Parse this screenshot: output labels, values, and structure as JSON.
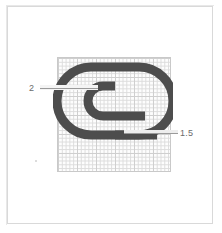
{
  "figure": {
    "background_color": "#ffffff",
    "frame_color": "#d9d9d9"
  },
  "grid": {
    "name": "graph-paper-grid",
    "line_color": "#dcdcdc",
    "major_line_color": "#cfcfcf",
    "border_color": "#c9c9c9",
    "cell_size_px": 3.8
  },
  "shape": {
    "name": "spiral-profile",
    "stroke_color": "#4d4d4d",
    "stroke_width_px": 9,
    "turns": 1.5
  },
  "annotations": [
    {
      "id": "outer-wall-thickness",
      "label": "2",
      "target": "outer spiral stroke",
      "side": "left"
    },
    {
      "id": "inner-wall-thickness",
      "label": "1.5",
      "target": "inner spiral arm end",
      "side": "right"
    }
  ]
}
